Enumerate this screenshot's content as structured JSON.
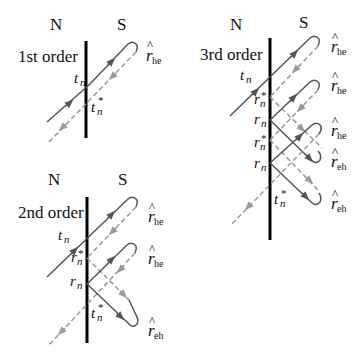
{
  "colors": {
    "barrier": "#000000",
    "solid_path": "#555555",
    "dashed_path": "#9a9a9a",
    "text": "#111111"
  },
  "panels": [
    {
      "id": "first",
      "title": "1st order",
      "left_label": "N",
      "right_label": "S",
      "point_labels": [
        {
          "base": "t",
          "sub": "n",
          "star": false
        },
        {
          "base": "t",
          "sub": "n",
          "star": true
        }
      ],
      "loop_labels": [
        {
          "hat": "r",
          "sub": "he"
        }
      ]
    },
    {
      "id": "second",
      "title": "2nd order",
      "left_label": "N",
      "right_label": "S",
      "point_labels": [
        {
          "base": "t",
          "sub": "n",
          "star": false
        },
        {
          "base": "r",
          "sub": "n",
          "star": true
        },
        {
          "base": "r",
          "sub": "n",
          "star": false
        },
        {
          "base": "t",
          "sub": "n",
          "star": true
        }
      ],
      "loop_labels": [
        {
          "hat": "r",
          "sub": "he"
        },
        {
          "hat": "r",
          "sub": "he"
        },
        {
          "hat": "r",
          "sub": "eh"
        }
      ]
    },
    {
      "id": "third",
      "title": "3rd order",
      "left_label": "N",
      "right_label": "S",
      "point_labels": [
        {
          "base": "t",
          "sub": "n",
          "star": false
        },
        {
          "base": "r",
          "sub": "n",
          "star": true
        },
        {
          "base": "r",
          "sub": "n",
          "star": false
        },
        {
          "base": "r",
          "sub": "n",
          "star": true
        },
        {
          "base": "r",
          "sub": "n",
          "star": false
        },
        {
          "base": "t",
          "sub": "n",
          "star": true
        }
      ],
      "loop_labels": [
        {
          "hat": "r",
          "sub": "he"
        },
        {
          "hat": "r",
          "sub": "he"
        },
        {
          "hat": "r",
          "sub": "he"
        },
        {
          "hat": "r",
          "sub": "eh"
        },
        {
          "hat": "r",
          "sub": "eh"
        }
      ]
    }
  ]
}
